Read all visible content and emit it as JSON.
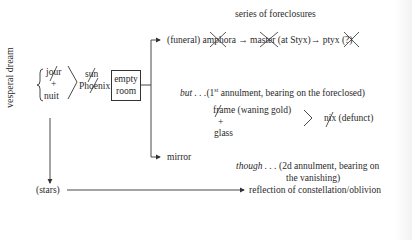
{
  "diagram": {
    "side_label": "vesperal dream",
    "brace_group": {
      "items": [
        "jour",
        "+",
        "nuit"
      ],
      "struck": [
        "jour"
      ]
    },
    "merge_result": {
      "items": [
        "sun",
        "Phoenix"
      ],
      "struck": [
        "sun",
        "Phoenix"
      ]
    },
    "box": {
      "line1": "empty",
      "line2": "room"
    },
    "header": "series of foreclosures",
    "upper_branch": {
      "prefix": "(funeral)",
      "chain": [
        "amphora",
        "master (at Styx)",
        "ptyx"
      ],
      "struck": [
        "amphora",
        "master",
        "ptyx"
      ],
      "suffix": "(?)",
      "arrow": "→"
    },
    "but_note": {
      "lead": "but . . .",
      "ordinal_num": "1",
      "ordinal_sup": "st",
      "rest": " annulment, bearing on the foreclosed)",
      "open": "("
    },
    "lower_branch": {
      "label": "mirror",
      "components": [
        "frame (waning gold)",
        "+",
        "glass"
      ],
      "struck": [
        "frame"
      ],
      "result": "nix (defunct)",
      "result_struck": [
        "nix"
      ]
    },
    "though_note": {
      "lead": "though . . .",
      "line1": "(2d annulment, bearing on",
      "line2": "the vanishing)"
    },
    "bottom": {
      "source": "(stars)",
      "target": "reflection of constellation/oblivion"
    },
    "colors": {
      "ink": "#2a2a2a",
      "strike": "#444444"
    }
  }
}
